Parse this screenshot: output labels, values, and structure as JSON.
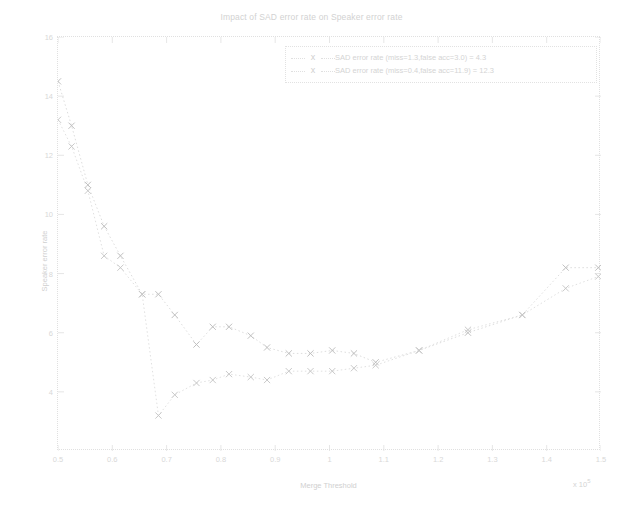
{
  "chart_data": {
    "type": "line",
    "title": "Impact of SAD error rate on Speaker error rate",
    "xlabel": "Merge Threshold",
    "ylabel": "Speaker error rate",
    "x_exponent": "x 10",
    "x_exponent_power": "5",
    "xlim": [
      0.5,
      1.5
    ],
    "ylim": [
      2.0,
      16.0
    ],
    "grid": false,
    "marker": "x",
    "linestyle": "dotted",
    "legend_position": "top-right",
    "xticks": [
      "0.5",
      "0.6",
      "0.7",
      "0.8",
      "0.9",
      "1",
      "1.1",
      "1.2",
      "1.3",
      "1.4",
      "1.5"
    ],
    "xtick_values": [
      0.5,
      0.6,
      0.7,
      0.8,
      0.9,
      1.0,
      1.1,
      1.2,
      1.3,
      1.4,
      1.5
    ],
    "yticks": [
      "16",
      "14",
      "12",
      "10",
      "8",
      "6",
      "4"
    ],
    "ytick_values": [
      16,
      14,
      12,
      10,
      8,
      6,
      4
    ],
    "series": [
      {
        "name": "SAD error rate (miss=1.3,false acc=3.0) = 4.3",
        "marker_symbol": "x",
        "color": "#d9d9d9",
        "x": [
          0.5,
          0.525,
          0.555,
          0.585,
          0.615,
          0.655,
          0.685,
          0.715,
          0.755,
          0.785,
          0.815,
          0.855,
          0.885,
          0.925,
          0.965,
          1.005,
          1.045,
          1.085,
          1.165,
          1.255,
          1.355,
          1.435,
          1.495
        ],
        "y": [
          14.5,
          13.0,
          11.0,
          9.6,
          8.6,
          7.3,
          7.3,
          6.6,
          5.6,
          6.2,
          6.2,
          5.9,
          5.5,
          5.3,
          5.3,
          5.4,
          5.3,
          5.0,
          5.4,
          6.0,
          6.6,
          8.2,
          8.2
        ]
      },
      {
        "name": "SAD error rate (miss=0.4,false acc=11.9) = 12.3",
        "marker_symbol": "x",
        "color": "#dcdcdc",
        "x": [
          0.5,
          0.525,
          0.555,
          0.585,
          0.615,
          0.655,
          0.685,
          0.715,
          0.755,
          0.785,
          0.815,
          0.855,
          0.885,
          0.925,
          0.965,
          1.005,
          1.045,
          1.085,
          1.165,
          1.255,
          1.355,
          1.435,
          1.495
        ],
        "y": [
          13.2,
          12.3,
          10.8,
          8.6,
          8.2,
          7.3,
          3.2,
          3.9,
          4.3,
          4.4,
          4.6,
          4.5,
          4.4,
          4.7,
          4.7,
          4.7,
          4.8,
          4.9,
          5.4,
          6.1,
          6.6,
          7.5,
          7.9
        ]
      }
    ]
  },
  "legend": {
    "entries": [
      "SAD error rate (miss=1.3,false acc=3.0) = 4.3",
      "SAD error rate (miss=0.4,false acc=11.9) = 12.3"
    ],
    "marker": "x"
  }
}
